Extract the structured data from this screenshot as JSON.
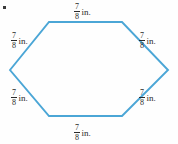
{
  "figure": {
    "kind": "hexagon-diagram",
    "shape_name": "hexagon",
    "stroke_color": "#4ba6d6",
    "label_color": "#2b2b2b",
    "background_color": "#fefefe",
    "bullet_marker": "square-bullet",
    "unit": "in.",
    "numerator": "7",
    "denominator": "8",
    "labels": [
      {
        "position": "top",
        "numerator": "7",
        "denominator": "8",
        "unit": "in."
      },
      {
        "position": "upper-left",
        "numerator": "7",
        "denominator": "8",
        "unit": "in."
      },
      {
        "position": "upper-right",
        "numerator": "7",
        "denominator": "8",
        "unit": "in."
      },
      {
        "position": "lower-left",
        "numerator": "7",
        "denominator": "8",
        "unit": "in."
      },
      {
        "position": "lower-right",
        "numerator": "7",
        "denominator": "8",
        "unit": "in."
      },
      {
        "position": "bottom",
        "numerator": "7",
        "denominator": "8",
        "unit": "in."
      }
    ],
    "vertices": [
      {
        "name": "left",
        "x": 10,
        "y": 70
      },
      {
        "name": "top-left",
        "x": 49,
        "y": 22
      },
      {
        "name": "top-right",
        "x": 122,
        "y": 22
      },
      {
        "name": "right",
        "x": 168,
        "y": 70
      },
      {
        "name": "bottom-right",
        "x": 122,
        "y": 116
      },
      {
        "name": "bottom-left",
        "x": 49,
        "y": 116
      }
    ]
  }
}
